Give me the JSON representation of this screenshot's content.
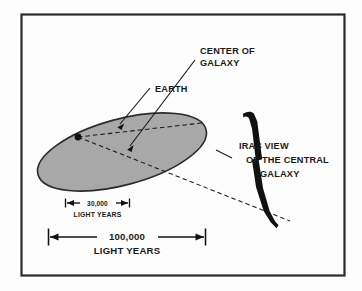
{
  "figure": {
    "frame_color": "#2b2b2b",
    "background_color": "#fdfdfd",
    "galaxy_disk_color": "#a8a8a8",
    "galaxy_disk_outline_color": "#2b2b2b",
    "beam_color": "#111111",
    "line_color": "#1a1a1a"
  },
  "labels": {
    "earth": "EARTH",
    "center_of_galaxy_line1": "CENTER OF",
    "center_of_galaxy_line2": "GALAXY",
    "iras_line1": "IRAS VIEW",
    "iras_line2": "OF THE CENTRAL",
    "iras_line3": "GALAXY"
  },
  "dimensions": {
    "small": {
      "value": "30,000",
      "units": "LIGHT YEARS"
    },
    "large": {
      "value": "100,000",
      "units": "LIGHT YEARS"
    }
  },
  "markers": {
    "earth_dot": "earth-position-dot"
  }
}
